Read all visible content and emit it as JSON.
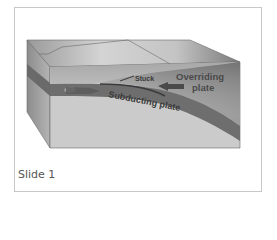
{
  "slide": {
    "caption": "Slide 1"
  },
  "diagram": {
    "labels": {
      "stuck": "Stuck",
      "overriding_line1": "Overriding",
      "overriding_line2": "plate",
      "subducting": "Subducting plate"
    },
    "colors": {
      "frame_border": "#c8c8c8",
      "top_face_light": "#d2d2d2",
      "top_face_dark": "#8a8a8a",
      "front_face": "#c9c9c9",
      "side_face": "#9a9a9a",
      "plate_band": "#6e6e6e",
      "label_text": "#4a4a4a",
      "caption_text": "#555555"
    }
  }
}
